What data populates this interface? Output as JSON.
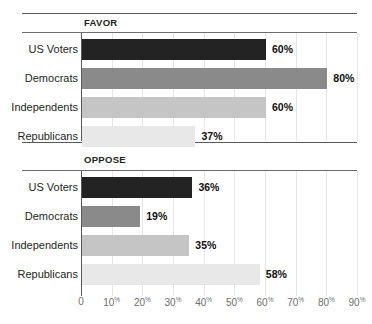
{
  "chart_data": {
    "type": "bar",
    "orientation": "horizontal",
    "title": "",
    "xlabel": "",
    "ylabel": "",
    "xlim": [
      0,
      90
    ],
    "grid": true,
    "legend": "none",
    "categories": [
      "US Voters",
      "Democrats",
      "Independents",
      "Republicans"
    ],
    "tick_labels": [
      "0",
      "10%",
      "20%",
      "30%",
      "40%",
      "50%",
      "60%",
      "70%",
      "80%",
      "90%"
    ],
    "tick_values": [
      0,
      10,
      20,
      30,
      40,
      50,
      60,
      70,
      80,
      90
    ],
    "panels": [
      {
        "label": "FAVOR",
        "values": [
          60,
          80,
          60,
          37
        ],
        "value_labels": [
          "60%",
          "80%",
          "60%",
          "37%"
        ]
      },
      {
        "label": "OPPOSE",
        "values": [
          36,
          19,
          35,
          58
        ],
        "value_labels": [
          "36%",
          "19%",
          "35%",
          "58%"
        ]
      }
    ],
    "series_colors": [
      "#232323",
      "#8a8a8a",
      "#c5c5c5",
      "#e8e8e8"
    ]
  }
}
